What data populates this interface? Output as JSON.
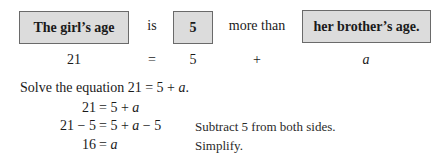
{
  "translation": {
    "boxes": [
      {
        "label": "The girl’s age"
      },
      {
        "label": "5"
      },
      {
        "label": "her brother’s age."
      }
    ],
    "connectors": [
      "is",
      "more than"
    ],
    "colors": {
      "box_fill": "#dcdcdc",
      "box_border": "#6a6a6a",
      "text": "#1a1a1a"
    }
  },
  "symbolic_row": {
    "items": [
      "21",
      "=",
      "5",
      "+",
      "a"
    ]
  },
  "instruction": {
    "text_prefix": "Solve the equation 21 = 5 + ",
    "variable": "a",
    "text_suffix": "."
  },
  "solution_steps": [
    {
      "left": "21",
      "right_prefix": "= 5 + ",
      "right_var": "a",
      "right_suffix": "",
      "note": ""
    },
    {
      "left": "21 − 5",
      "right_prefix": "= 5 + ",
      "right_var": "a",
      "right_suffix": " − 5",
      "note": "Subtract 5 from both sides."
    },
    {
      "left": "16",
      "right_prefix": "= ",
      "right_var": "a",
      "right_suffix": "",
      "note": "Simplify."
    }
  ]
}
